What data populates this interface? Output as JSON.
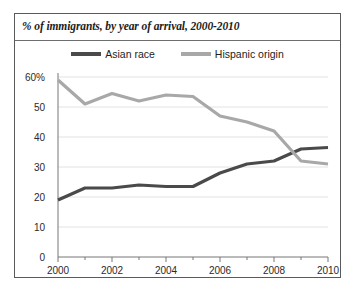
{
  "chart": {
    "title": "% of immigrants, by year of arrival, 2000-2010",
    "legend": [
      {
        "name": "asian-race",
        "label": "Asian race",
        "color": "#4a4a4a"
      },
      {
        "name": "hispanic-origin",
        "label": "Hispanic origin",
        "color": "#a8a8a8"
      }
    ]
  },
  "axes": {
    "y_ticks": [
      "60%",
      "50",
      "40",
      "30",
      "20",
      "10",
      "0"
    ],
    "x_ticks": [
      "2000",
      "2002",
      "2004",
      "2006",
      "2008",
      "2010"
    ]
  },
  "chart_data": {
    "type": "line",
    "title": "% of immigrants, by year of arrival, 2000-2010",
    "xlabel": "",
    "ylabel": "",
    "x": [
      2000,
      2001,
      2002,
      2003,
      2004,
      2005,
      2006,
      2007,
      2008,
      2009,
      2010
    ],
    "xlim": [
      2000,
      2010
    ],
    "ylim": [
      0,
      60
    ],
    "ytick_values": [
      0,
      10,
      20,
      30,
      40,
      50,
      60
    ],
    "ytick_labels": [
      "0",
      "10",
      "20",
      "30",
      "40",
      "50",
      "60%"
    ],
    "xtick_values": [
      2000,
      2002,
      2004,
      2006,
      2008,
      2010
    ],
    "xtick_labels": [
      "2000",
      "2002",
      "2004",
      "2006",
      "2008",
      "2010"
    ],
    "grid": true,
    "legend_position": "top-center",
    "series": [
      {
        "name": "Asian race",
        "color": "#4a4a4a",
        "values": [
          19,
          23,
          23,
          24,
          23.5,
          23.5,
          28,
          31,
          32,
          36,
          36.5
        ]
      },
      {
        "name": "Hispanic origin",
        "color": "#a8a8a8",
        "values": [
          59,
          51,
          54.5,
          52,
          54,
          53.5,
          47,
          45,
          42,
          32,
          31
        ]
      }
    ]
  }
}
